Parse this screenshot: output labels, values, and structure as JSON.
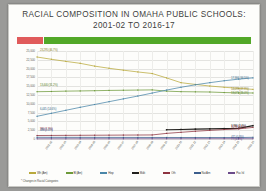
{
  "slide": {
    "title_line1": "RACIAL COMPOSITION IN OMAHA PUBLIC SCHOOLS:",
    "title_line2": "2001-02 TO 2016-17",
    "footnote": "* Changes in Racial Categories",
    "banner_red": "#e05b5b",
    "banner_green": "#52a828"
  },
  "chart_data": {
    "type": "line",
    "title": "RACIAL COMPOSITION IN OMAHA PUBLIC SCHOOLS: 2001-02 TO 2016-17",
    "xlabel": "",
    "ylabel": "",
    "ylim": [
      0,
      25000
    ],
    "grid": true,
    "legend_position": "bottom",
    "categories": [
      "2001-02",
      "2002-03",
      "2003-04",
      "2004-05",
      "2005-06",
      "2006-07",
      "2007-08",
      "2008-09",
      "2009-10",
      "2010-11",
      "2011-12",
      "2012-13",
      "2013-14",
      "2014-15",
      "2015-16",
      "2016-17"
    ],
    "yticks": [
      "0",
      "2,500",
      "5,000",
      "7,500",
      "10,000",
      "12,500",
      "15,000",
      "17,500",
      "20,000",
      "22,500",
      "25,000"
    ],
    "series": [
      {
        "name": "Wh (Am)",
        "color": "#b9a93c",
        "values": [
          23295,
          22650,
          22050,
          21500,
          20700,
          20100,
          19550,
          19050,
          18600,
          17350,
          16000,
          15500,
          15050,
          14700,
          14400,
          14095
        ]
      },
      {
        "name": "Bl (Am)",
        "color": "#6d9a3a",
        "values": [
          13440,
          13500,
          13600,
          13650,
          13720,
          13800,
          13850,
          13900,
          13950,
          13600,
          13450,
          13400,
          13350,
          13200,
          13100,
          13071
        ]
      },
      {
        "name": "Hisp",
        "color": "#4a86a8",
        "values": [
          6445,
          7300,
          8150,
          9000,
          9800,
          10600,
          11400,
          12200,
          13050,
          13900,
          14700,
          15400,
          16000,
          16550,
          17000,
          17366
        ]
      },
      {
        "name": "Multi",
        "color": "#201f1c",
        "values": [
          null,
          null,
          null,
          null,
          null,
          null,
          null,
          null,
          null,
          2620,
          2700,
          2790,
          2870,
          2950,
          3030,
          3786
        ]
      },
      {
        "name": "Oth",
        "color": "#8e3440",
        "values": [
          990,
          1010,
          1030,
          1050,
          1070,
          1090,
          1110,
          1130,
          1150,
          1600,
          1900,
          2200,
          2450,
          2680,
          2880,
          3294
        ]
      },
      {
        "name": "Nat Am",
        "color": "#3c5e8c",
        "values": [
          480,
          470,
          465,
          460,
          455,
          450,
          445,
          440,
          435,
          430,
          425,
          420,
          415,
          410,
          405,
          471
        ]
      },
      {
        "name": "Pac Isl",
        "color": "#6b4b8a",
        "values": [
          60,
          62,
          64,
          66,
          68,
          70,
          72,
          74,
          76,
          78,
          80,
          82,
          84,
          86,
          88,
          77
        ]
      }
    ],
    "point_labels": [
      {
        "text": "23,295 (46.7%)",
        "series": "Wh (Am)",
        "index": 0,
        "color": "#8a7d28",
        "side": "right"
      },
      {
        "text": "14,095 (27.9%)",
        "series": "Wh (Am)",
        "index": 15,
        "color": "#8a7d28",
        "side": "right"
      },
      {
        "text": "13,440 (31.2%)",
        "series": "Bl (Am)",
        "index": 0,
        "color": "#5a7f2d",
        "side": "right"
      },
      {
        "text": "13,071 (26.0%)",
        "series": "Bl (Am)",
        "index": 15,
        "color": "#5a7f2d",
        "side": "right"
      },
      {
        "text": "6,445 (14.6%)",
        "series": "Hisp",
        "index": 0,
        "color": "#3b6d8c",
        "side": "right"
      },
      {
        "text": "17,366 (34.5%)",
        "series": "Hisp",
        "index": 15,
        "color": "#3b6d8c",
        "side": "right"
      },
      {
        "text": "3,786 (2.4%)",
        "series": "Multi",
        "index": 15,
        "color": "#201f1c",
        "side": "right"
      },
      {
        "text": "3,294 (4.0%)",
        "series": "Oth",
        "index": 15,
        "color": "#8e3440",
        "side": "right"
      },
      {
        "text": "990 (1.9%)",
        "series": "Oth",
        "index": 0,
        "color": "#8e3440",
        "side": "right"
      },
      {
        "text": "471 (0.9%)",
        "series": "Nat Am",
        "index": 15,
        "color": "#3c5e8c",
        "side": "right"
      },
      {
        "text": "77 (0.1%)",
        "series": "Pac Isl",
        "index": 15,
        "color": "#6b4b8a",
        "side": "right"
      },
      {
        "text": "480 (1.0%)",
        "series": "Nat Am",
        "index": 0,
        "color": "#3c5e8c",
        "side": "right"
      }
    ]
  }
}
